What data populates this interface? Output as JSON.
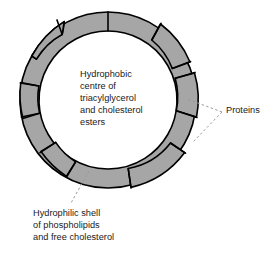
{
  "figure": {
    "background_color": "#ffffff",
    "shell_fill_color": "#a6a6a6",
    "outline_color": "#000000",
    "core_fill_color": "#ffffff",
    "text_color": "#1a1a1a",
    "leader_line_color": "#9a9a9a"
  },
  "labels": {
    "core": {
      "name": "hydrophobic-core-label",
      "lines": [
        "Hydrophobic",
        "centre of",
        "triacylglycerol",
        "and cholesterol",
        "esters"
      ],
      "text": "Hydrophobic\ncentre of\ntriacylglycerol\nand cholesterol\nesters"
    },
    "shell": {
      "name": "hydrophilic-shell-label",
      "lines": [
        "Hydrophilic shell",
        "of phospholipids",
        "and free cholesterol"
      ],
      "text": "Hydrophilic shell\nof phospholipids\nand free cholesterol"
    },
    "proteins": {
      "name": "proteins-label",
      "text": "Proteins"
    }
  },
  "geometry": {
    "center_x": 108,
    "center_y": 100,
    "outer_radius": 88,
    "inner_radius": 69,
    "segment_count": 11,
    "protein_bulge_count": 5
  },
  "leaders": {
    "proteins_apex": {
      "x": 222,
      "y": 112
    },
    "proteins_target_upper": {
      "x": 187,
      "y": 99
    },
    "proteins_target_lower": {
      "x": 192,
      "y": 143
    },
    "shell_from": {
      "x": 89,
      "y": 171
    },
    "shell_to": {
      "x": 71,
      "y": 203
    }
  }
}
